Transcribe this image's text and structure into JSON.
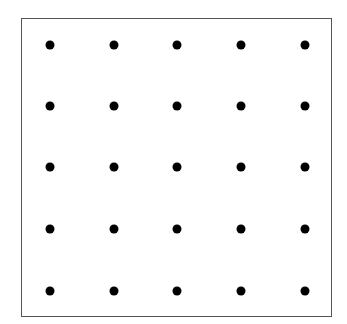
{
  "diagram": {
    "type": "dot-grid",
    "rows": 5,
    "columns": 5,
    "dot_color": "#000000",
    "border_color": "#555555",
    "background_color": "#ffffff",
    "column_x": [
      50,
      114,
      177,
      241,
      305
    ],
    "row_y": [
      45,
      106,
      167,
      229,
      291
    ],
    "dot_diameter": 9
  }
}
